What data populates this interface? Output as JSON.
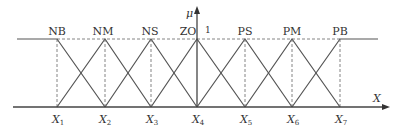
{
  "diagram": {
    "y_axis_label": "μ",
    "x_axis_label": "X",
    "peak_value_label": "1",
    "sets": [
      {
        "label": "NB",
        "peak": "X1",
        "shape": "left-shoulder"
      },
      {
        "label": "NM",
        "peak": "X2",
        "shape": "triangle"
      },
      {
        "label": "NS",
        "peak": "X3",
        "shape": "triangle"
      },
      {
        "label": "ZO",
        "peak": "X4",
        "shape": "triangle"
      },
      {
        "label": "PS",
        "peak": "X5",
        "shape": "triangle"
      },
      {
        "label": "PM",
        "peak": "X6",
        "shape": "triangle"
      },
      {
        "label": "PB",
        "peak": "X7",
        "shape": "right-shoulder"
      }
    ],
    "x_ticks": [
      {
        "base": "X",
        "sub": "1"
      },
      {
        "base": "X",
        "sub": "2"
      },
      {
        "base": "X",
        "sub": "3"
      },
      {
        "base": "X",
        "sub": "4"
      },
      {
        "base": "X",
        "sub": "5"
      },
      {
        "base": "X",
        "sub": "6"
      },
      {
        "base": "X",
        "sub": "7"
      }
    ],
    "line_color": "#555555"
  }
}
